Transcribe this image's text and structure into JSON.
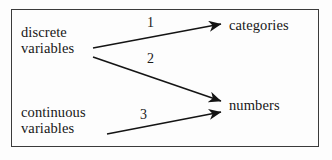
{
  "figure": {
    "border_color": "#3b3b3b",
    "background_color": "#fdfdfd",
    "ink_color": "#171717"
  },
  "nodes": {
    "discrete_variables": "discrete\nvariables",
    "continuous_variables": "continuous\nvariables",
    "categories": "categories",
    "numbers": "numbers"
  },
  "edges": [
    {
      "id": "edge-1",
      "label": "1",
      "from": "discrete_variables",
      "to": "categories",
      "x1": 93,
      "y1": 48,
      "x2": 221,
      "y2": 24
    },
    {
      "id": "edge-2",
      "label": "2",
      "from": "discrete_variables",
      "to": "numbers",
      "x1": 93,
      "y1": 57,
      "x2": 221,
      "y2": 101
    },
    {
      "id": "edge-3",
      "label": "3",
      "from": "continuous_variables",
      "to": "numbers",
      "x1": 107,
      "y1": 134,
      "x2": 221,
      "y2": 112
    }
  ]
}
